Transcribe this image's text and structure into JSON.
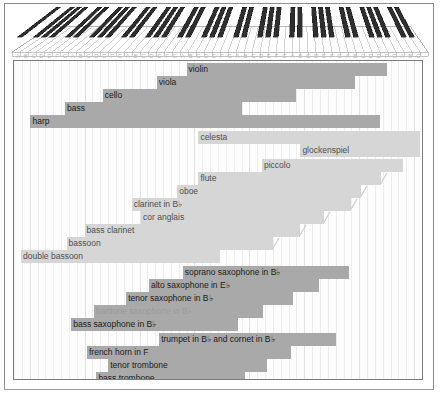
{
  "figure": {
    "keyboard": {
      "octaves": 7,
      "white_keys": 52,
      "label": "piano-keyboard"
    },
    "note_letters": [
      "A",
      "B",
      "C",
      "D",
      "E",
      "F",
      "G",
      "A",
      "B",
      "C",
      "D",
      "E",
      "F",
      "G",
      "A",
      "B",
      "C",
      "D",
      "E",
      "F",
      "G",
      "A",
      "B",
      "C",
      "D",
      "E",
      "F",
      "G",
      "A",
      "B",
      "C",
      "D",
      "E",
      "F",
      "G",
      "A",
      "B",
      "C",
      "D",
      "E",
      "F",
      "G",
      "A",
      "B",
      "C",
      "D",
      "E",
      "F",
      "G",
      "A",
      "B",
      "C"
    ]
  },
  "colors": {
    "bar_dark": "#a9a9a9",
    "bar_light": "#d6d6d6",
    "frame": "#7d7d7d",
    "grid": "#ededed",
    "text_dark": "#1b1b1b",
    "text_light": "#4f4f4f",
    "text_faded": "#9b9b9b",
    "page_bg": "#ffffff"
  },
  "chart_data": {
    "type": "bar",
    "orientation": "horizontal-range",
    "xlabel": "",
    "ylabel": "",
    "x_axis": {
      "unit": "white-key index on an 88-key piano",
      "min": 0,
      "max": 52,
      "tick_labels": [
        "A",
        "B",
        "C",
        "D",
        "E",
        "F",
        "G",
        "A",
        "B",
        "C",
        "D",
        "E",
        "F",
        "G",
        "A",
        "B",
        "C",
        "D",
        "E",
        "F",
        "G",
        "A",
        "B",
        "C",
        "D",
        "E",
        "F",
        "G",
        "A",
        "B",
        "C",
        "D",
        "E",
        "F",
        "G",
        "A",
        "B",
        "C",
        "D",
        "E",
        "F",
        "G",
        "A",
        "B",
        "C",
        "D",
        "E",
        "F",
        "G",
        "A",
        "B",
        "C"
      ],
      "grid": true
    },
    "legend": {
      "position": "none",
      "entries": []
    },
    "groups": [
      {
        "name": "strings-and-harp",
        "bars": [
          {
            "label": "violin",
            "start": 22.0,
            "end": 47.5,
            "shade": "dark",
            "label_pos": "inside",
            "extension": false
          },
          {
            "label": "viola",
            "start": 18.2,
            "end": 43.5,
            "shade": "dark",
            "label_pos": "inside",
            "extension": false
          },
          {
            "label": "cello",
            "start": 11.3,
            "end": 36.0,
            "shade": "dark",
            "label_pos": "inside",
            "extension": false
          },
          {
            "label": "bass",
            "start": 6.5,
            "end": 29.0,
            "shade": "dark",
            "label_pos": "inside",
            "extension": false
          },
          {
            "label": "harp",
            "start": 2.1,
            "end": 46.7,
            "shade": "dark",
            "label_pos": "inside",
            "extension": false
          }
        ]
      },
      {
        "name": "tuned-percussion",
        "bars": [
          {
            "label": "celesta",
            "start": 23.5,
            "end": 51.7,
            "shade": "light",
            "label_pos": "inside",
            "extension": false
          },
          {
            "label": "glockenspiel",
            "start": 36.5,
            "end": 51.7,
            "shade": "light",
            "label_pos": "inside",
            "extension": false
          }
        ]
      },
      {
        "name": "woodwind",
        "bars": [
          {
            "label": "piccolo",
            "start": 31.6,
            "end": 49.6,
            "shade": "light",
            "label_pos": "inside",
            "extension": false
          },
          {
            "label": "flute",
            "start": 23.5,
            "end": 46.8,
            "shade": "light",
            "label_pos": "inside",
            "extension": true
          },
          {
            "label": "oboe",
            "start": 20.8,
            "end": 44.2,
            "shade": "light",
            "label_pos": "inside",
            "extension": true
          },
          {
            "label": "clarinet in B♭",
            "start": 15.0,
            "end": 43.0,
            "shade": "light",
            "label_pos": "inside",
            "extension": true
          },
          {
            "label": "cor anglais",
            "start": 16.2,
            "end": 39.5,
            "shade": "light",
            "label_pos": "inside",
            "extension": true
          },
          {
            "label": "bass clarinet",
            "start": 9.0,
            "end": 36.5,
            "shade": "light",
            "label_pos": "inside",
            "extension": true
          },
          {
            "label": "bassoon",
            "start": 6.7,
            "end": 33.0,
            "shade": "light",
            "label_pos": "inside",
            "extension": true
          },
          {
            "label": "double bassoon",
            "start": 0.9,
            "end": 26.3,
            "shade": "light",
            "label_pos": "inside",
            "extension": false
          }
        ]
      },
      {
        "name": "saxophones",
        "bars": [
          {
            "label": "soprano saxophone in B♭",
            "start": 21.5,
            "end": 42.7,
            "shade": "dark",
            "label_pos": "inside",
            "extension": false
          },
          {
            "label": "alto saxophone in E♭",
            "start": 17.2,
            "end": 38.9,
            "shade": "dark",
            "label_pos": "inside",
            "extension": false
          },
          {
            "label": "tenor saxophone in B♭",
            "start": 14.3,
            "end": 35.6,
            "shade": "dark",
            "label_pos": "inside",
            "extension": false
          },
          {
            "label": "baritone  saxophone  in B♭",
            "start": 10.2,
            "end": 31.7,
            "shade": "dark",
            "label_pos": "inside",
            "extension": false,
            "faded": true
          },
          {
            "label": "bass saxophone in B♭",
            "start": 7.3,
            "end": 28.6,
            "shade": "dark",
            "label_pos": "inside",
            "extension": false
          }
        ]
      },
      {
        "name": "brass",
        "bars": [
          {
            "label": "trumpet in B♭ and cornet  in B♭",
            "start": 18.5,
            "end": 41.0,
            "shade": "dark",
            "label_pos": "inside",
            "extension": false
          },
          {
            "label": "french horn in F",
            "start": 9.3,
            "end": 35.3,
            "shade": "dark",
            "label_pos": "inside",
            "extension": false
          },
          {
            "label": "tenor trombone",
            "start": 12.0,
            "end": 32.2,
            "shade": "dark",
            "label_pos": "inside",
            "extension": false
          },
          {
            "label": "bass trombone",
            "start": 10.5,
            "end": 29.4,
            "shade": "dark",
            "label_pos": "inside",
            "extension": false
          },
          {
            "label": "tuba in B♭",
            "start": 4.4,
            "end": 25.5,
            "shade": "dark",
            "label_pos": "inside",
            "extension": false
          }
        ]
      }
    ]
  }
}
